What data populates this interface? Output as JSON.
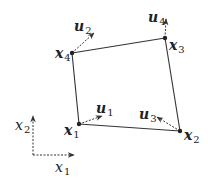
{
  "diagram": {
    "type": "quadrilateral element with node displacement vectors",
    "colors": {
      "stroke": "#333333",
      "text": "#222222",
      "background": "#ffffff"
    },
    "nodes": [
      {
        "id": "x1",
        "base": "x",
        "sub": "1",
        "x": 79,
        "y": 124,
        "label_x": 64,
        "label_y": 123
      },
      {
        "id": "x2",
        "base": "x",
        "sub": "2",
        "x": 180,
        "y": 131,
        "label_x": 184,
        "label_y": 128
      },
      {
        "id": "x3",
        "base": "x",
        "sub": "3",
        "x": 165,
        "y": 38,
        "label_x": 169,
        "label_y": 38
      },
      {
        "id": "x4",
        "base": "x",
        "sub": "4",
        "x": 72,
        "y": 53,
        "label_x": 55,
        "label_y": 46
      }
    ],
    "edges": [
      [
        "x1",
        "x2"
      ],
      [
        "x2",
        "x3"
      ],
      [
        "x3",
        "x4"
      ],
      [
        "x4",
        "x1"
      ]
    ],
    "vectors": [
      {
        "id": "u1",
        "base": "u",
        "sub": "1",
        "from": [
          79,
          124
        ],
        "to": [
          102,
          116
        ],
        "label_x": 96,
        "label_y": 101
      },
      {
        "id": "u2",
        "base": "u",
        "sub": "2",
        "from": [
          72,
          53
        ],
        "to": [
          94,
          33
        ],
        "label_x": 74,
        "label_y": 19
      },
      {
        "id": "u3",
        "base": "u",
        "sub": "3",
        "from": [
          180,
          131
        ],
        "to": [
          157,
          117
        ],
        "label_x": 139,
        "label_y": 107
      },
      {
        "id": "u4",
        "base": "u",
        "sub": "4",
        "from": [
          165,
          38
        ],
        "to": [
          166,
          19
        ],
        "label_x": 148,
        "label_y": 10
      }
    ],
    "axes": {
      "origin": [
        33,
        155
      ],
      "x1_axis": {
        "to": [
          74,
          155
        ],
        "base": "x",
        "sub": "1",
        "label_x": 55,
        "label_y": 160
      },
      "x2_axis": {
        "to": [
          33,
          116
        ],
        "base": "x",
        "sub": "2",
        "label_x": 15,
        "label_y": 118
      }
    }
  }
}
